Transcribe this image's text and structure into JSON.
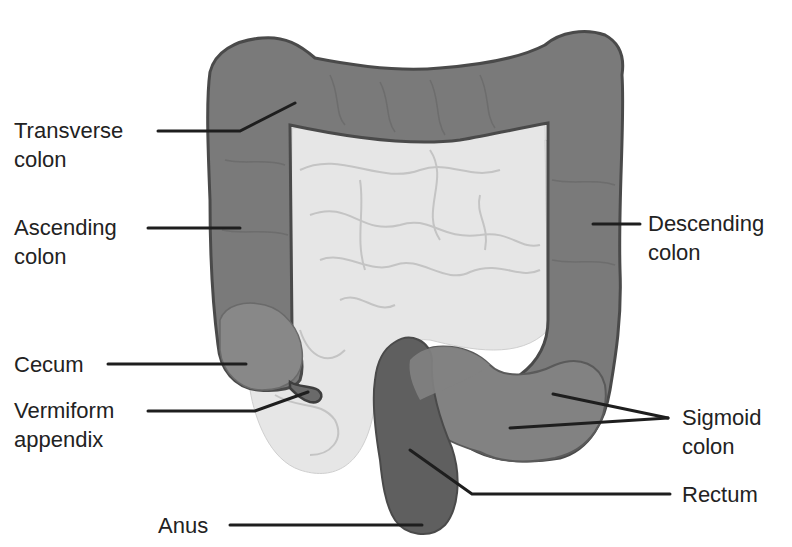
{
  "colors": {
    "colon_fill": "#7a7a7a",
    "colon_outline": "#4a4a4a",
    "cecum_fill": "#888888",
    "small_intestine_fill": "#e6e6e6",
    "small_intestine_lines": "#c4c4c4",
    "rectum_fill": "#5f5f5f",
    "leader_line": "#1e1e1e",
    "text": "#222222"
  },
  "labels": {
    "transverse": {
      "line1": "Transverse",
      "line2": "colon"
    },
    "ascending": {
      "line1": "Ascending",
      "line2": "colon"
    },
    "cecum": {
      "line1": "Cecum"
    },
    "appendix": {
      "line1": "Vermiform",
      "line2": "appendix"
    },
    "anus": {
      "line1": "Anus"
    },
    "descending": {
      "line1": "Descending",
      "line2": "colon"
    },
    "sigmoid": {
      "line1": "Sigmoid",
      "line2": "colon"
    },
    "rectum": {
      "line1": "Rectum"
    }
  }
}
